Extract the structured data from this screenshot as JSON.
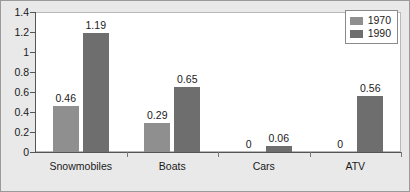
{
  "chart_data": {
    "type": "bar",
    "title": "",
    "subtitle": "",
    "xlabel": "",
    "ylabel": "",
    "categories": [
      "Snowmobiles",
      "Boats",
      "Cars",
      "ATV"
    ],
    "series": [
      {
        "name": "1970",
        "color": "#8f8f8f",
        "values": [
          0.46,
          0.29,
          0,
          0
        ]
      },
      {
        "name": "1990",
        "color": "#6e6e6e",
        "values": [
          1.19,
          0.65,
          0.06,
          0.56
        ]
      }
    ],
    "data_labels": [
      [
        "0.46",
        "0.29",
        "0",
        "0"
      ],
      [
        "1.19",
        "0.65",
        "0.06",
        "0.56"
      ]
    ],
    "ylim": [
      0,
      1.4
    ],
    "ytick_values": [
      0,
      0.2,
      0.4,
      0.6,
      0.8,
      1,
      1.2,
      1.4
    ],
    "ytick_labels": [
      "0",
      "0.2",
      "0.4",
      "0.6",
      "0.8",
      "1",
      "1.2",
      "1.4"
    ],
    "grid": false,
    "legend": {
      "position": "top-right-inside",
      "entries": [
        {
          "label": "1970",
          "color": "#8f8f8f"
        },
        {
          "label": "1990",
          "color": "#6e6e6e"
        }
      ]
    },
    "plot_background": "#ffffff",
    "figure_background": "#e9e9e9"
  }
}
